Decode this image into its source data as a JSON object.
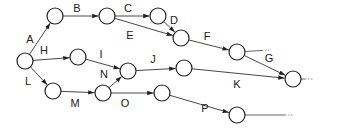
{
  "diagram": {
    "type": "activity-network",
    "nodes": [
      "n0",
      "n1",
      "n2",
      "n3",
      "n4",
      "n5",
      "n6",
      "n7",
      "n8",
      "n9",
      "n10",
      "n11",
      "n12",
      "n13"
    ],
    "edges": [
      {
        "label": "A",
        "from": "n0",
        "to": "n1"
      },
      {
        "label": "B",
        "from": "n1",
        "to": "n2"
      },
      {
        "label": "C",
        "from": "n2",
        "to": "n3"
      },
      {
        "label": "D",
        "from": "n3",
        "to": "n4"
      },
      {
        "label": "E",
        "from": "n2",
        "to": "n4"
      },
      {
        "label": "F",
        "from": "n4",
        "to": "n5"
      },
      {
        "label": "G",
        "from": "n5",
        "to": "n9"
      },
      {
        "label": "H",
        "from": "n0",
        "to": "n6"
      },
      {
        "label": "I",
        "from": "n6",
        "to": "n7"
      },
      {
        "label": "J",
        "from": "n7",
        "to": "n8"
      },
      {
        "label": "K",
        "from": "n8",
        "to": "n9"
      },
      {
        "label": "L",
        "from": "n0",
        "to": "n10"
      },
      {
        "label": "M",
        "from": "n10",
        "to": "n11"
      },
      {
        "label": "N",
        "from": "n11",
        "to": "n7"
      },
      {
        "label": "O",
        "from": "n11",
        "to": "n12"
      },
      {
        "label": "P",
        "from": "n12",
        "to": "n13"
      }
    ],
    "continuations": [
      "n5",
      "n9",
      "n13"
    ]
  }
}
